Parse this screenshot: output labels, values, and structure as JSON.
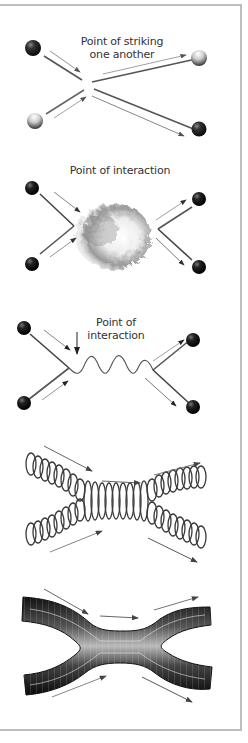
{
  "figure": {
    "panels": [
      {
        "id": "classical-collision",
        "label_line1": "Point of striking",
        "label_line2": "one another"
      },
      {
        "id": "interaction-cloud",
        "label": "Point of interaction"
      },
      {
        "id": "feynman-exchange",
        "label": "Point of interaction"
      },
      {
        "id": "string-helix",
        "label": ""
      },
      {
        "id": "string-tube",
        "label": ""
      }
    ],
    "colors": {
      "frame": "#bdbdbd",
      "line": "#555555",
      "arrow": "#666666",
      "ball_dark": "#1a1a1a",
      "ball_light": "#e0e0e0"
    }
  }
}
